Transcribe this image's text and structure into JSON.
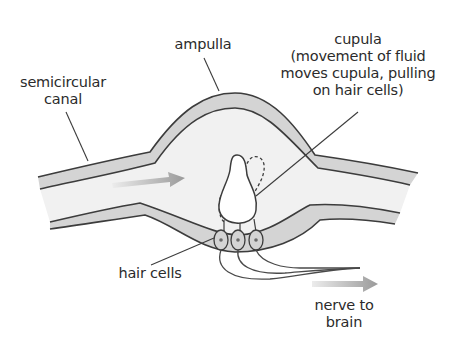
{
  "diagram": {
    "labels": {
      "semicircular_canal": [
        "semicircular",
        "canal"
      ],
      "ampulla": "ampulla",
      "cupula": [
        "cupula",
        "(movement of fluid",
        "moves cupula, pulling",
        "on hair cells)"
      ],
      "hair_cells": "hair cells",
      "nerve": [
        "nerve to",
        "brain"
      ]
    },
    "arrows": [
      {
        "name": "fluid-flow-arrow",
        "meaning": "direction of fluid movement"
      },
      {
        "name": "nerve-signal-arrow",
        "meaning": "signal to brain"
      }
    ],
    "hair_cell_count": 3,
    "colors": {
      "wall_fill": "#d4d4d4",
      "lumen_fill": "#f1f1f1",
      "outline": "#3c3c3c",
      "arrow": "#9a9a9a",
      "text": "#2b2b2b"
    }
  }
}
